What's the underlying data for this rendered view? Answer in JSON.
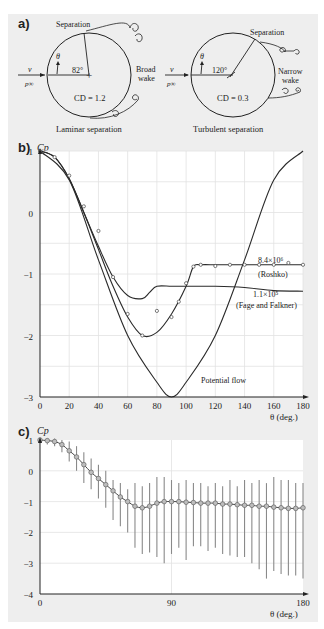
{
  "panel_a": {
    "label": "a)",
    "left": {
      "separation_label": "Separation",
      "angle_label": "82°",
      "theta_label": "θ",
      "velocity_label": "v",
      "pressure_label": "p∞",
      "wake_label_1": "Broad",
      "wake_label_2": "wake",
      "drag_label": "CD = 1.2",
      "caption": "Laminar separation"
    },
    "right": {
      "separation_label": "Separation",
      "angle_label": "120°",
      "theta_label": "θ",
      "velocity_label": "v",
      "pressure_label": "p∞",
      "wake_label_1": "Narrow",
      "wake_label_2": "wake",
      "drag_label": "CD = 0.3",
      "caption": "Turbulent separation"
    }
  },
  "panel_b": {
    "label": "b)",
    "ylabel": "Cp",
    "xlabel": "θ (deg.)",
    "yticks": [
      "1",
      "0",
      "−1",
      "−2",
      "−3"
    ],
    "xticks": [
      "0",
      "20",
      "40",
      "60",
      "80",
      "100",
      "120",
      "140",
      "160",
      "180"
    ],
    "annotations": {
      "roshko_re": "8.4×10⁶",
      "roshko": "(Roshko)",
      "fage_re": "1.1×10⁵",
      "fage": "(Fage and Falkner)",
      "potential": "Potential flow"
    }
  },
  "panel_c": {
    "label": "c)",
    "ylabel": "Cp",
    "xlabel": "θ (deg.)",
    "yticks": [
      "1",
      "0",
      "−1",
      "−2",
      "−3",
      "−4"
    ],
    "xticks": [
      "0",
      "90",
      "180"
    ]
  },
  "chart_data": [
    {
      "type": "line",
      "title": "b) Pressure coefficient around a circular cylinder",
      "xlabel": "θ (deg.)",
      "ylabel": "Cp",
      "xlim": [
        0,
        180
      ],
      "ylim": [
        -3,
        1
      ],
      "grid": true,
      "series": [
        {
          "name": "Potential flow",
          "x": [
            0,
            20,
            40,
            60,
            80,
            90,
            100,
            120,
            140,
            160,
            180
          ],
          "y": [
            1,
            0.53,
            -0.77,
            -2.0,
            -2.76,
            -3.0,
            -2.76,
            -2.0,
            -0.77,
            0.53,
            1
          ]
        },
        {
          "name": "8.4×10⁶ (Roshko)",
          "x": [
            0,
            10,
            20,
            30,
            40,
            50,
            60,
            70,
            80,
            90,
            100,
            105,
            110,
            120,
            130,
            140,
            150,
            160,
            170,
            180
          ],
          "y": [
            1,
            0.9,
            0.55,
            0.0,
            -0.6,
            -1.2,
            -1.7,
            -2.0,
            -1.95,
            -1.65,
            -1.2,
            -0.88,
            -0.85,
            -0.85,
            -0.85,
            -0.85,
            -0.85,
            -0.85,
            -0.85,
            -0.85
          ]
        },
        {
          "name": "1.1×10⁵ (Fage and Falkner)",
          "x": [
            0,
            10,
            20,
            30,
            40,
            50,
            60,
            70,
            75,
            80,
            90,
            100,
            120,
            140,
            160,
            180
          ],
          "y": [
            1,
            0.9,
            0.55,
            0.0,
            -0.55,
            -1.05,
            -1.35,
            -1.4,
            -1.3,
            -1.2,
            -1.2,
            -1.2,
            -1.2,
            -1.22,
            -1.27,
            -1.28
          ]
        },
        {
          "name": "Roshko data points",
          "x": [
            0,
            10,
            20,
            30,
            40,
            50,
            60,
            70,
            80,
            90,
            95,
            100,
            105,
            110,
            120,
            130,
            140,
            150,
            160,
            170,
            180
          ],
          "y": [
            1,
            0.9,
            0.6,
            0.1,
            -0.3,
            -1.05,
            -1.65,
            -2.0,
            -1.6,
            -1.7,
            -1.45,
            -1.15,
            -0.88,
            -0.85,
            -0.87,
            -0.85,
            -0.85,
            -0.85,
            -0.85,
            -0.82,
            -0.85
          ]
        }
      ],
      "annotations": [
        "8.4×10⁶ (Roshko)",
        "1.1×10⁵ (Fage and Falkner)",
        "Potential flow"
      ]
    },
    {
      "type": "line",
      "title": "c) Cp with error bars",
      "xlabel": "θ (deg.)",
      "ylabel": "Cp",
      "xlim": [
        0,
        180
      ],
      "ylim": [
        -4,
        1
      ],
      "grid": true,
      "series": [
        {
          "name": "mean Cp",
          "x": [
            0,
            5,
            10,
            15,
            20,
            25,
            30,
            35,
            40,
            45,
            50,
            55,
            60,
            65,
            70,
            75,
            80,
            85,
            90,
            95,
            100,
            105,
            110,
            115,
            120,
            125,
            130,
            135,
            140,
            145,
            150,
            155,
            160,
            165,
            170,
            175,
            180
          ],
          "y": [
            1,
            0.98,
            0.95,
            0.85,
            0.65,
            0.45,
            0.2,
            -0.05,
            -0.25,
            -0.45,
            -0.65,
            -0.85,
            -1.0,
            -1.15,
            -1.2,
            -1.15,
            -1.05,
            -1.0,
            -1.0,
            -1.0,
            -1.02,
            -1.03,
            -1.05,
            -1.05,
            -1.05,
            -1.08,
            -1.08,
            -1.1,
            -1.12,
            -1.12,
            -1.15,
            -1.15,
            -1.18,
            -1.2,
            -1.22,
            -1.22,
            -1.2
          ],
          "err_upper": [
            1.05,
            1.05,
            1.05,
            1.0,
            0.95,
            0.8,
            0.6,
            0.4,
            0.2,
            0.0,
            -0.3,
            -0.4,
            -0.6,
            -0.4,
            -0.5,
            -0.4,
            -0.2,
            -0.2,
            -0.3,
            -0.4,
            -0.3,
            -0.4,
            -0.4,
            -0.5,
            -0.4,
            -0.5,
            -0.3,
            -0.5,
            -0.3,
            -0.4,
            -0.3,
            -0.4,
            -0.2,
            -0.3,
            -0.3,
            -0.4,
            -0.4
          ],
          "err_lower": [
            0.9,
            0.85,
            0.8,
            0.6,
            0.3,
            0.0,
            -0.4,
            -0.6,
            -0.9,
            -1.2,
            -1.6,
            -1.8,
            -2.0,
            -2.5,
            -2.7,
            -2.65,
            -2.8,
            -3.0,
            -2.7,
            -2.5,
            -2.9,
            -2.45,
            -2.45,
            -2.6,
            -2.5,
            -2.7,
            -2.75,
            -2.8,
            -2.8,
            -3.0,
            -3.2,
            -3.5,
            -3.25,
            -3.35,
            -3.4,
            -3.4,
            -3.5
          ]
        }
      ]
    }
  ]
}
